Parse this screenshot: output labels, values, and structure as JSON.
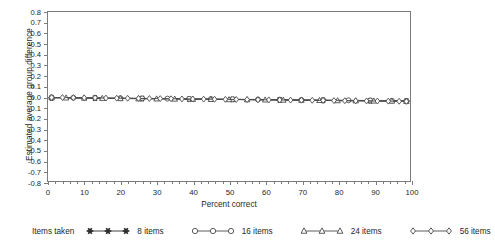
{
  "chart_data": {
    "type": "line",
    "title": "",
    "xlabel": "Percent correct",
    "ylabel": "Estimated average group difference",
    "xlim": [
      0,
      100
    ],
    "ylim": [
      -0.8,
      0.8
    ],
    "xticks": [
      0,
      10,
      20,
      30,
      40,
      50,
      60,
      70,
      80,
      90,
      100
    ],
    "xtick_labels": [
      "0",
      "10",
      "20",
      "30",
      "40",
      "50",
      "60",
      "70",
      "80",
      "90",
      "100"
    ],
    "x_minor_step": 2,
    "yticks": [
      0.8,
      0.7,
      0.6,
      0.5,
      0.4,
      0.3,
      0.2,
      0.1,
      0.0,
      -0.1,
      -0.2,
      -0.3,
      -0.4,
      -0.5,
      -0.6,
      -0.7,
      -0.8
    ],
    "ytick_labels": [
      "0.8",
      "0.7",
      "0.6",
      "0.5",
      "0.4",
      "0.3",
      "0.2",
      "0.1",
      "0.0",
      "-0.1",
      "-0.2",
      "-0.3",
      "-0.4",
      "-0.5",
      "-0.6",
      "-0.7",
      "-0.8"
    ],
    "grid": false,
    "legend_position": "below",
    "legend_title": "Items taken",
    "axis_color": "#7b7b7b",
    "series": [
      {
        "name": "8 items",
        "marker": "star",
        "color": "#2b2b2b",
        "filled": true,
        "x": [
          1,
          13,
          26,
          39,
          51,
          64,
          76,
          89,
          99
        ],
        "values": [
          -0.012,
          -0.016,
          -0.02,
          -0.024,
          -0.028,
          -0.032,
          -0.036,
          -0.04,
          -0.044
        ]
      },
      {
        "name": "16 items",
        "marker": "circle",
        "color": "#4a4a4a",
        "filled": false,
        "x": [
          1,
          7,
          13,
          20,
          26,
          33,
          39,
          45,
          51,
          58,
          64,
          70,
          76,
          83,
          89,
          95,
          99
        ],
        "values": [
          -0.01,
          -0.012,
          -0.014,
          -0.016,
          -0.018,
          -0.02,
          -0.022,
          -0.024,
          -0.026,
          -0.028,
          -0.03,
          -0.032,
          -0.034,
          -0.036,
          -0.038,
          -0.04,
          -0.042
        ]
      },
      {
        "name": "24 items",
        "marker": "triangle",
        "color": "#4a4a4a",
        "filled": false,
        "x": [
          1,
          5,
          10,
          15,
          20,
          25,
          30,
          35,
          40,
          45,
          50,
          55,
          60,
          65,
          70,
          75,
          80,
          85,
          90,
          95,
          99
        ],
        "values": [
          -0.011,
          -0.013,
          -0.015,
          -0.017,
          -0.019,
          -0.021,
          -0.022,
          -0.024,
          -0.026,
          -0.027,
          -0.029,
          -0.03,
          -0.032,
          -0.034,
          -0.035,
          -0.037,
          -0.039,
          -0.04,
          -0.042,
          -0.043,
          -0.045
        ]
      },
      {
        "name": "56 items",
        "marker": "diamond",
        "color": "#4a4a4a",
        "filled": false,
        "x": [
          1,
          4,
          7,
          10,
          13,
          16,
          19,
          22,
          25,
          28,
          31,
          34,
          37,
          40,
          43,
          46,
          49,
          52,
          55,
          58,
          61,
          64,
          67,
          70,
          73,
          76,
          79,
          82,
          85,
          88,
          91,
          94,
          97,
          99
        ],
        "values": [
          -0.009,
          -0.01,
          -0.011,
          -0.012,
          -0.013,
          -0.015,
          -0.016,
          -0.017,
          -0.018,
          -0.019,
          -0.02,
          -0.021,
          -0.023,
          -0.024,
          -0.025,
          -0.026,
          -0.027,
          -0.028,
          -0.029,
          -0.031,
          -0.032,
          -0.033,
          -0.034,
          -0.035,
          -0.036,
          -0.037,
          -0.039,
          -0.04,
          -0.041,
          -0.042,
          -0.043,
          -0.044,
          -0.045,
          -0.046
        ]
      }
    ]
  }
}
